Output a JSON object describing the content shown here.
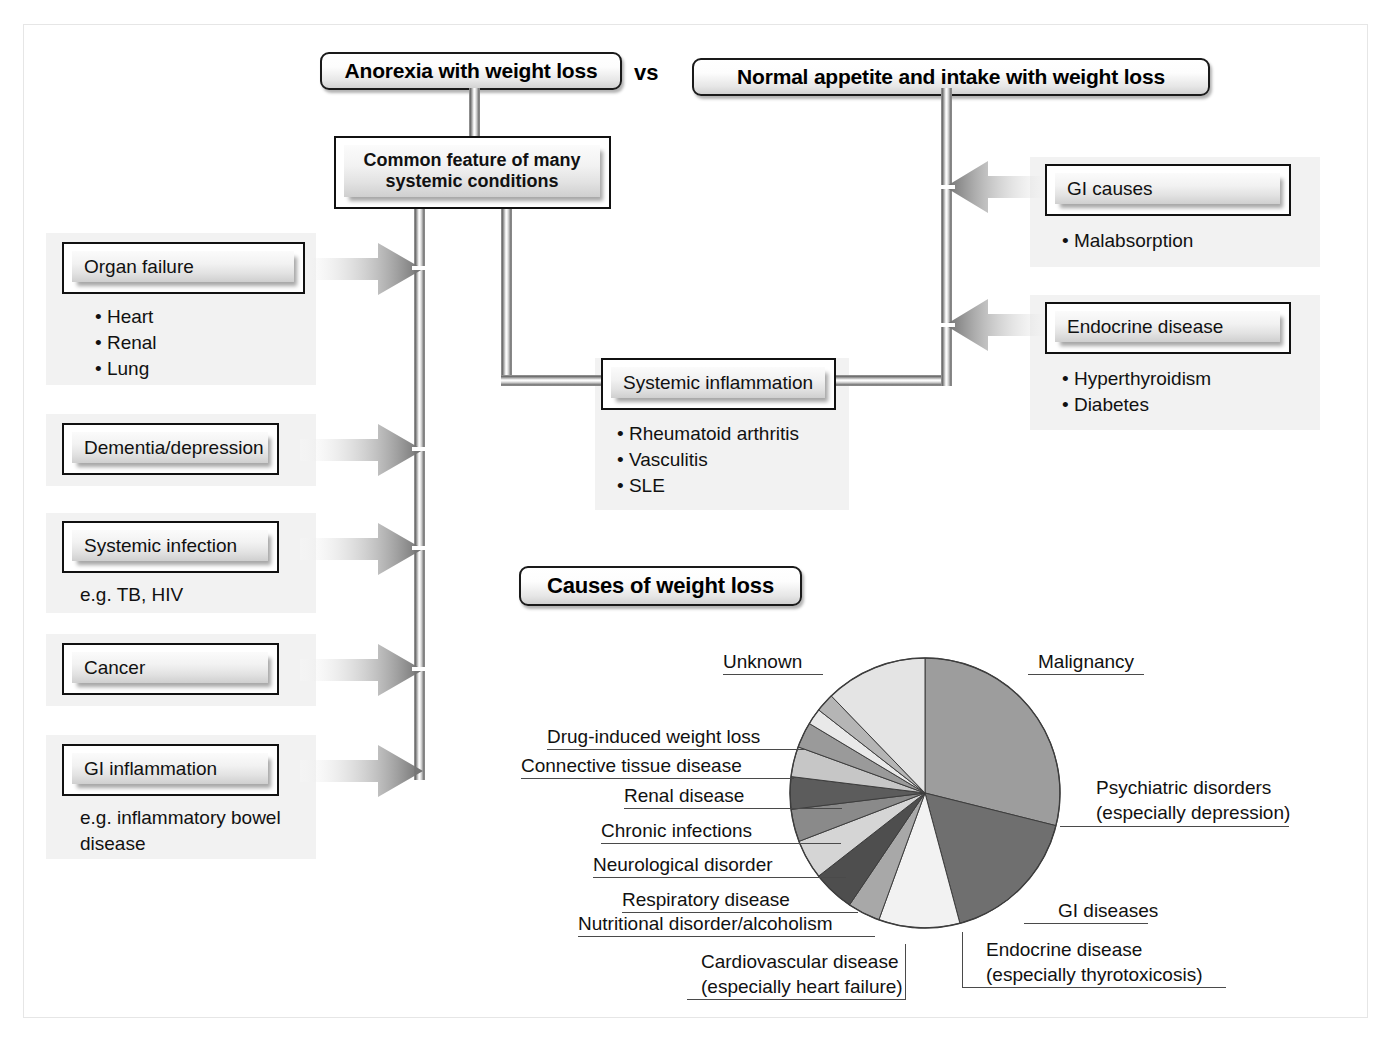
{
  "figure": {
    "vs_label": "vs",
    "headers": [
      {
        "id": "anorexia",
        "label": "Anorexia with weight loss"
      },
      {
        "id": "normal-appetite",
        "label": "Normal appetite and intake with weight loss"
      },
      {
        "id": "causes-of-weight-loss",
        "label": "Causes of weight loss"
      }
    ],
    "center_box": {
      "line1": "Common feature of many",
      "line2": "systemic conditions"
    },
    "left_nodes": [
      {
        "id": "organ-failure",
        "label": "Organ failure",
        "bullets": [
          "• Heart",
          "• Renal",
          "• Lung"
        ]
      },
      {
        "id": "dementia-depression",
        "label": "Dementia/depression",
        "bullets": []
      },
      {
        "id": "systemic-infection",
        "label": "Systemic infection",
        "bullets": [
          "e.g. TB, HIV"
        ]
      },
      {
        "id": "cancer",
        "label": "Cancer",
        "bullets": []
      },
      {
        "id": "gi-inflammation",
        "label": "GI inflammation",
        "bullets": [
          "e.g. inflammatory bowel",
          "disease"
        ]
      }
    ],
    "right_nodes": [
      {
        "id": "gi-causes",
        "label": "GI causes",
        "bullets": [
          "• Malabsorption"
        ]
      },
      {
        "id": "endocrine-disease",
        "label": "Endocrine disease",
        "bullets": [
          "• Hyperthyroidism",
          "• Diabetes"
        ]
      }
    ],
    "middle_node": {
      "id": "systemic-inflammation",
      "label": "Systemic inflammation",
      "bullets": [
        "• Rheumatoid arthritis",
        "• Vasculitis",
        "• SLE"
      ]
    }
  },
  "chart_data": {
    "type": "pie",
    "title": "Causes of weight loss",
    "legend": "labels-with-leader-lines",
    "grid": false,
    "labels": [
      "Malignancy",
      "Psychiatric disorders\n(especially depression)",
      "GI diseases",
      "Endocrine disease\n(especially thyrotoxicosis)",
      "Cardiovascular disease\n(especially heart failure)",
      "Nutritional disorder/alcoholism",
      "Respiratory disease",
      "Neurological disorder",
      "Chronic infections",
      "Renal disease",
      "Connective tissue disease",
      "Drug-induced weight loss",
      "Unknown"
    ],
    "slices": [
      {
        "label": "Malignancy",
        "value": 29,
        "start_deg": 0,
        "end_deg": 104,
        "color": "#9d9d9d"
      },
      {
        "label": "Psychiatric disorders (especially depression)",
        "value": 17,
        "start_deg": 104,
        "end_deg": 165,
        "color": "#6f6f6f"
      },
      {
        "label": "GI diseases",
        "value": 10,
        "start_deg": 165,
        "end_deg": 200,
        "color": "#f2f2f2"
      },
      {
        "label": "Endocrine disease (especially thyrotoxicosis)",
        "value": 4,
        "start_deg": 200,
        "end_deg": 214,
        "color": "#a8a8a8"
      },
      {
        "label": "Cardiovascular disease (especially heart failure)",
        "value": 5,
        "start_deg": 214,
        "end_deg": 232,
        "color": "#4e4e4e"
      },
      {
        "label": "Nutritional disorder/alcoholism",
        "value": 5,
        "start_deg": 232,
        "end_deg": 249,
        "color": "#d5d5d5"
      },
      {
        "label": "Respiratory disease",
        "value": 4,
        "start_deg": 249,
        "end_deg": 263,
        "color": "#8a8a8a"
      },
      {
        "label": "Neurological disorder",
        "value": 4,
        "start_deg": 263,
        "end_deg": 277,
        "color": "#5c5c5c"
      },
      {
        "label": "Chronic infections",
        "value": 4,
        "start_deg": 277,
        "end_deg": 290,
        "color": "#c6c6c6"
      },
      {
        "label": "Renal disease",
        "value": 3,
        "start_deg": 290,
        "end_deg": 301,
        "color": "#9a9a9a"
      },
      {
        "label": "Connective tissue disease",
        "value": 2,
        "start_deg": 301,
        "end_deg": 308,
        "color": "#e9e9e9"
      },
      {
        "label": "Drug-induced weight loss",
        "value": 2,
        "start_deg": 308,
        "end_deg": 316,
        "color": "#b5b5b5"
      },
      {
        "label": "Unknown",
        "value": 12,
        "start_deg": 316,
        "end_deg": 360,
        "color": "#e4e4e4"
      }
    ],
    "center": {
      "x": 925,
      "y": 793
    },
    "radius": 135
  },
  "colors": {
    "outline": "#111111",
    "frame": "#e6e6e6",
    "panel": "#f2f2f2",
    "arrow_dark": "#6d6d6d",
    "leader": "#4a4a4a"
  }
}
